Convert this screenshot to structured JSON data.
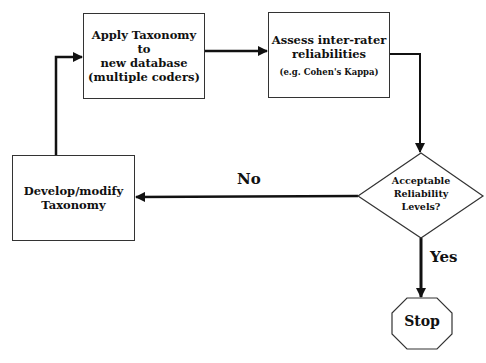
{
  "diagram": {
    "nodes": {
      "apply": {
        "line1": "Apply Taxonomy to",
        "line2": "new database",
        "line3": "(multiple coders)"
      },
      "assess": {
        "line1": "Assess inter-rater",
        "line2": "reliabilities",
        "sub": "(e.g. Cohen's Kappa)"
      },
      "develop": {
        "line1": "Develop/modify",
        "line2": "Taxonomy"
      },
      "decision": {
        "line1": "Acceptable",
        "line2": "Reliability",
        "line3": "Levels?"
      },
      "stop": {
        "label": "Stop"
      }
    },
    "edges": {
      "no_label": "No",
      "yes_label": "Yes"
    },
    "colors": {
      "stroke": "#111111",
      "background": "#ffffff"
    }
  }
}
